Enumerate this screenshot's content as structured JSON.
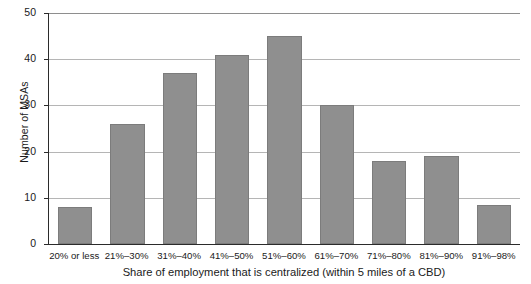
{
  "chart_data": {
    "type": "bar",
    "title": "",
    "xlabel": "Share of employment that is centralized (within 5 miles of a CBD)",
    "ylabel": "Number of MSAs",
    "categories": [
      "20% or less",
      "21%–30%",
      "31%–40%",
      "41%–50%",
      "51%–60%",
      "61%–70%",
      "71%–80%",
      "81%–90%",
      "91%–98%"
    ],
    "values": [
      8,
      26,
      37,
      41,
      45,
      30,
      18,
      19,
      8.5
    ],
    "ylim": [
      0,
      50
    ],
    "yticks": [
      0,
      10,
      20,
      30,
      40,
      50
    ],
    "ytick_labels": [
      "0",
      "10",
      "20",
      "30",
      "40",
      "50"
    ],
    "grid": true,
    "grid_axis": "y",
    "legend": false,
    "bar_color": "#8f8f8f",
    "axis_color": "#2b2b2b",
    "grid_color": "#b5b5b5"
  }
}
